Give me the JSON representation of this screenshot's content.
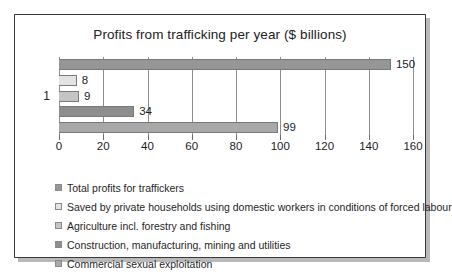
{
  "chart_data": {
    "type": "bar",
    "orientation": "horizontal",
    "title": "Profits from trafficking per year ($ billions)",
    "xlabel": "",
    "ylabel": "",
    "categories": [
      "1"
    ],
    "xlim": [
      0,
      160
    ],
    "xticks": [
      "0",
      "20",
      "40",
      "60",
      "80",
      "100",
      "120",
      "140",
      "160"
    ],
    "xtick_values": [
      0,
      20,
      40,
      60,
      80,
      100,
      120,
      140,
      160
    ],
    "grid": "vertical",
    "legend_position": "bottom-left",
    "series": [
      {
        "name": "Total profits for traffickers",
        "value": 150,
        "label": "150",
        "color": "#969696"
      },
      {
        "name": "Saved by private households using domestic workers in conditions of forced labour",
        "value": 8,
        "label": "8",
        "color": "#e3e3e3"
      },
      {
        "name": "Agriculture incl. forestry and fishing",
        "value": 9,
        "label": "9",
        "color": "#c4c4c4"
      },
      {
        "name": "Construction, manufacturing, mining and utilities",
        "value": 34,
        "label": "34",
        "color": "#8e8e8e"
      },
      {
        "name": "Commercial sexual exploitation",
        "value": 99,
        "label": "99",
        "color": "#a8a8a8"
      }
    ]
  },
  "legend": {
    "items": [
      {
        "label": "Total profits for traffickers",
        "color": "#969696"
      },
      {
        "label": "Saved by private households using domestic workers in conditions of forced labour",
        "color": "#e3e3e3"
      },
      {
        "label": "Agriculture incl. forestry and fishing",
        "color": "#c4c4c4"
      },
      {
        "label": "Construction, manufacturing, mining and utilities",
        "color": "#8e8e8e"
      },
      {
        "label": "Commercial sexual exploitation",
        "color": "#a8a8a8"
      }
    ]
  },
  "colors": {
    "frame": "#3a3a3a",
    "background": "#ffffff",
    "gridline": "#8e8e8e",
    "text": "#1d1d1d"
  }
}
